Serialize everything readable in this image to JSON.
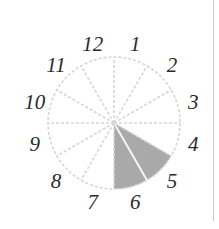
{
  "diagram": {
    "type": "clock-fraction",
    "center": [
      114,
      123
    ],
    "radius": 66,
    "label_radius": 82,
    "sectors": 12,
    "shaded_sectors": [
      5,
      6
    ],
    "labels": [
      "1",
      "2",
      "3",
      "4",
      "5",
      "6",
      "7",
      "8",
      "9",
      "10",
      "11",
      "12"
    ],
    "colors": {
      "shade": "#a9a9a9",
      "grid": "#d6d6d6",
      "label": "#2a2a2a",
      "border": "#c8c8c8"
    }
  }
}
